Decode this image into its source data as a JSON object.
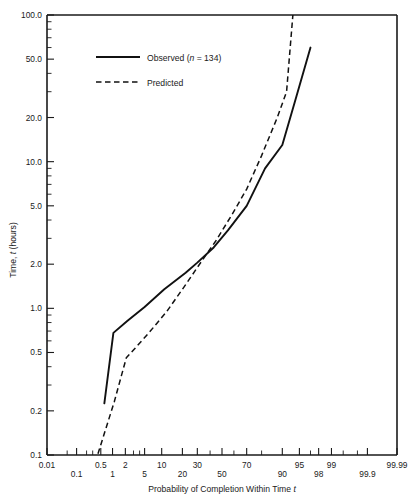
{
  "chart_data": {
    "type": "line",
    "title": "",
    "subtitle": "",
    "xlabel": "Probability of Completion Within Time t",
    "ylabel": "Time, t (hours)",
    "ylabel_main": "Time,",
    "ylabel_italic": "t",
    "ylabel_unit": "(hours)",
    "xlabel_main": "Probability of Completion Within Time",
    "xlabel_italic": "t",
    "x_scale": "normal-probability",
    "y_scale": "log",
    "ylim": [
      0.1,
      100.0
    ],
    "xlim_percent": [
      0.01,
      99.99
    ],
    "grid": false,
    "legend_position": "top-left",
    "x_tick_labels": [
      "0.01",
      "0.1",
      "0.5",
      "1",
      "2",
      "5",
      "10",
      "20",
      "30",
      "50",
      "70",
      "90",
      "95",
      "98",
      "99",
      "99.9",
      "99.99"
    ],
    "x_tick_values": [
      0.01,
      0.1,
      0.5,
      1,
      2,
      5,
      10,
      20,
      30,
      50,
      70,
      90,
      95,
      98,
      99,
      99.9,
      99.99
    ],
    "x_tick_minor_values": [
      0.05,
      0.2,
      0.3,
      3,
      4,
      40,
      60,
      80,
      97,
      99.5,
      99.8
    ],
    "y_tick_labels": [
      "100.0",
      "50.0",
      "20.0",
      "10.0",
      "5.0",
      "2.0",
      "1.0",
      "0.5",
      "0.2",
      "0.1"
    ],
    "y_tick_values": [
      100.0,
      50.0,
      20.0,
      10.0,
      5.0,
      2.0,
      1.0,
      0.5,
      0.2,
      0.1
    ],
    "y_tick_minor_values": [
      90,
      80,
      70,
      60,
      40,
      30,
      9,
      8,
      7,
      6,
      4,
      3,
      0.9,
      0.8,
      0.7,
      0.6,
      0.4,
      0.3
    ],
    "series": [
      {
        "name": "Observed (n = 134)",
        "label_main": "Observed (",
        "label_italic": "n",
        "label_tail": " = 134)",
        "style": "solid",
        "color": "#111111",
        "points": [
          {
            "p": 0.62,
            "t": 0.225
          },
          {
            "p": 1.05,
            "t": 0.68
          },
          {
            "p": 2.2,
            "t": 0.82
          },
          {
            "p": 5.0,
            "t": 1.02
          },
          {
            "p": 11.0,
            "t": 1.35
          },
          {
            "p": 22.0,
            "t": 1.75
          },
          {
            "p": 30.0,
            "t": 2.05
          },
          {
            "p": 43.0,
            "t": 2.6
          },
          {
            "p": 55.0,
            "t": 3.4
          },
          {
            "p": 70.0,
            "t": 5.0
          },
          {
            "p": 82.0,
            "t": 9.0
          },
          {
            "p": 90.0,
            "t": 13.0
          },
          {
            "p": 94.0,
            "t": 26.0
          },
          {
            "p": 97.0,
            "t": 60.0
          }
        ]
      },
      {
        "name": "Predicted",
        "label_main": "Predicted",
        "style": "dashed",
        "color": "#111111",
        "points": [
          {
            "p": 0.42,
            "t": 0.102
          },
          {
            "p": 1.1,
            "t": 0.23
          },
          {
            "p": 2.1,
            "t": 0.46
          },
          {
            "p": 3.0,
            "t": 0.52
          },
          {
            "p": 6.0,
            "t": 0.68
          },
          {
            "p": 12.0,
            "t": 0.95
          },
          {
            "p": 22.0,
            "t": 1.45
          },
          {
            "p": 30.0,
            "t": 1.9
          },
          {
            "p": 45.0,
            "t": 2.9
          },
          {
            "p": 58.0,
            "t": 4.3
          },
          {
            "p": 70.0,
            "t": 6.5
          },
          {
            "p": 80.0,
            "t": 11.0
          },
          {
            "p": 88.0,
            "t": 20.0
          },
          {
            "p": 91.5,
            "t": 30.0
          },
          {
            "p": 92.5,
            "t": 55.0
          },
          {
            "p": 93.4,
            "t": 100.0
          }
        ]
      }
    ]
  }
}
